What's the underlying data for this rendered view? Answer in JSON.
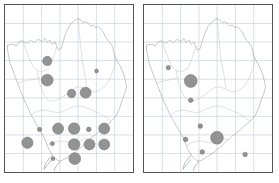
{
  "figure": {
    "kind": "proportional-symbol-map-pair",
    "panel_count": 2,
    "background_color": "#ffffff",
    "frame_color": "#555555",
    "grid_color": "#c9d2dd",
    "outline_color": "#9a9a9a",
    "symbol_fill": "#939393",
    "symbol_stroke": "#6f6f6f"
  },
  "chart_data": [
    {
      "type": "scatter",
      "title": "",
      "subtitle": "",
      "xlabel": "",
      "ylabel": "",
      "panel": "left",
      "legend": [],
      "grid": true,
      "xlim": [
        0,
        100
      ],
      "ylim": [
        0,
        100
      ],
      "basemap": {
        "name": "regional-boundary",
        "grid_columns": 7,
        "grid_rows": 9
      },
      "points": [
        {
          "x": 33.0,
          "y": 33.5,
          "r": 3.6
        },
        {
          "x": 33.0,
          "y": 45.0,
          "r": 4.6
        },
        {
          "x": 71.5,
          "y": 39.5,
          "r": 1.5
        },
        {
          "x": 52.0,
          "y": 53.0,
          "r": 3.3
        },
        {
          "x": 63.0,
          "y": 52.5,
          "r": 4.3
        },
        {
          "x": 27.0,
          "y": 74.5,
          "r": 1.7
        },
        {
          "x": 41.5,
          "y": 74.0,
          "r": 4.3
        },
        {
          "x": 54.0,
          "y": 74.0,
          "r": 4.5
        },
        {
          "x": 65.5,
          "y": 74.5,
          "r": 1.8
        },
        {
          "x": 77.5,
          "y": 74.0,
          "r": 4.3
        },
        {
          "x": 17.5,
          "y": 82.5,
          "r": 4.4
        },
        {
          "x": 37.0,
          "y": 83.0,
          "r": 1.6
        },
        {
          "x": 54.0,
          "y": 83.5,
          "r": 4.5
        },
        {
          "x": 66.0,
          "y": 83.5,
          "r": 4.3
        },
        {
          "x": 77.5,
          "y": 83.5,
          "r": 4.3
        },
        {
          "x": 37.5,
          "y": 92.0,
          "r": 1.5
        },
        {
          "x": 54.5,
          "y": 92.0,
          "r": 4.6
        }
      ]
    },
    {
      "type": "scatter",
      "title": "",
      "subtitle": "",
      "xlabel": "",
      "ylabel": "",
      "panel": "right",
      "legend": [],
      "grid": true,
      "xlim": [
        0,
        100
      ],
      "ylim": [
        0,
        100
      ],
      "basemap": {
        "name": "regional-boundary",
        "grid_columns": 7,
        "grid_rows": 9
      },
      "points": [
        {
          "x": 19.0,
          "y": 37.5,
          "r": 1.7
        },
        {
          "x": 36.5,
          "y": 45.5,
          "r": 5.0
        },
        {
          "x": 36.5,
          "y": 57.0,
          "r": 1.8
        },
        {
          "x": 44.0,
          "y": 72.5,
          "r": 1.8
        },
        {
          "x": 32.5,
          "y": 80.5,
          "r": 1.8
        },
        {
          "x": 57.0,
          "y": 79.5,
          "r": 5.0
        },
        {
          "x": 45.5,
          "y": 88.0,
          "r": 1.8
        },
        {
          "x": 79.0,
          "y": 89.5,
          "r": 1.8
        }
      ]
    }
  ]
}
